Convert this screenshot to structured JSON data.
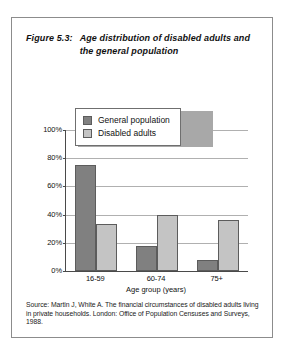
{
  "figure": {
    "number": "Figure 5.3:",
    "title": "Age distribution of disabled adults and the general population",
    "source": "Source: Martin J, White A. The financial circumstances of disabled adults living in private households. London: Office of Population Censuses and Surveys, 1988."
  },
  "colors": {
    "general_population": "#808080",
    "disabled_adults": "#c4c4c4",
    "axis": "#4a4a4a",
    "gridline": "#b0b0b0",
    "border": "#8c8c8c"
  },
  "legend": {
    "position": "top-center-overlay",
    "entries": [
      {
        "label": "General population",
        "color": "#808080"
      },
      {
        "label": "Disabled adults",
        "color": "#c4c4c4"
      }
    ]
  },
  "chart_data": {
    "type": "bar",
    "title": "Age distribution of disabled adults and the general population",
    "subtitle": "",
    "xlabel": "Age group (years)",
    "ylabel": "",
    "categories": [
      "16-59",
      "60-74",
      "75+"
    ],
    "series": [
      {
        "name": "General population",
        "color": "#808080",
        "values": [
          75,
          18,
          8
        ]
      },
      {
        "name": "Disabled adults",
        "color": "#c4c4c4",
        "values": [
          33,
          40,
          36
        ]
      }
    ],
    "ylim": [
      0,
      100
    ],
    "ytick_values": [
      0,
      20,
      40,
      60,
      80,
      100
    ],
    "ytick_labels": [
      "0%",
      "20%",
      "40%",
      "60%",
      "80%",
      "100%"
    ],
    "grid": true,
    "grid_axis": "y",
    "legend_position": "upper center",
    "units": "percent"
  }
}
